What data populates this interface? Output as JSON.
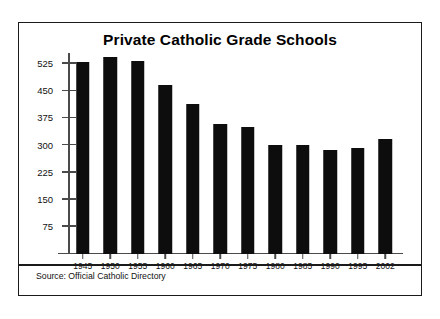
{
  "figure": {
    "title": "Private Catholic Grade Schools",
    "source_note": "Source: Official Catholic Directory"
  },
  "chart_data": {
    "type": "bar",
    "title": "Private Catholic Grade Schools",
    "xlabel": "",
    "ylabel": "",
    "categories": [
      "1945",
      "1950",
      "1955",
      "1960",
      "1965",
      "1970",
      "1975",
      "1980",
      "1985",
      "1990",
      "1995",
      "2002"
    ],
    "values": [
      530,
      545,
      533,
      468,
      415,
      359,
      350,
      302,
      300,
      288,
      293,
      317
    ],
    "ytick_labels": [
      "75",
      "150",
      "225",
      "300",
      "375",
      "450",
      "525"
    ],
    "yticks": [
      75,
      150,
      225,
      300,
      375,
      450,
      525
    ],
    "ylim": [
      0,
      555
    ],
    "grid": false,
    "legend": false,
    "bar_color": "#0d0d0d",
    "axis_color": "#4a4a4a",
    "annotation": "Source: Official Catholic Directory"
  }
}
